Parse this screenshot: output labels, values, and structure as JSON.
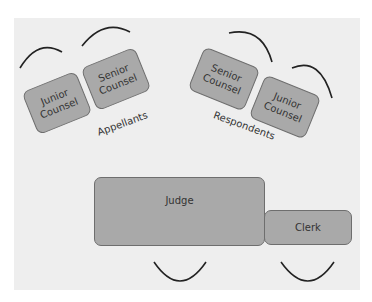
{
  "diagram": {
    "title": "",
    "left_group": {
      "label": "Appellants",
      "seats": [
        {
          "label_line1": "Junior",
          "label_line2": "Counsel"
        },
        {
          "label_line1": "Senior",
          "label_line2": "Counsel"
        }
      ]
    },
    "right_group": {
      "label": "Respondents",
      "seats": [
        {
          "label_line1": "Senior",
          "label_line2": "Counsel"
        },
        {
          "label_line1": "Junior",
          "label_line2": "Counsel"
        }
      ]
    },
    "bench": {
      "judge": "Judge",
      "clerk": "Clerk"
    },
    "colors": {
      "box_fill": "#a9a9a9",
      "box_border": "#6e6e6e",
      "background": "#eeeeee",
      "arc": "#222222"
    }
  }
}
